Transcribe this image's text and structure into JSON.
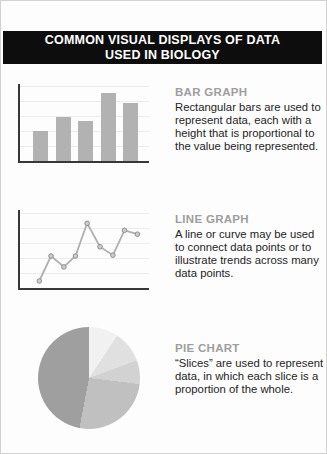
{
  "header": {
    "title_line1": "COMMON VISUAL DISPLAYS OF DATA",
    "title_line2": "USED IN BIOLOGY",
    "bg_color": "#0d0d0d",
    "text_color": "#ffffff"
  },
  "sections": {
    "bar": {
      "heading": "BAR GRAPH",
      "body": "Rectangular bars are used to represent data, each with a height that is proportional to the value being represented."
    },
    "line": {
      "heading": "LINE GRAPH",
      "body": "A line or curve may be used to connect data points or to illustrate trends across many data points."
    },
    "pie": {
      "heading": "PIE CHART",
      "body": "“Slices” are used to represent data, in which each slice is a proportion of the whole."
    }
  },
  "chart_data": [
    {
      "type": "bar",
      "name": "bar-graph-example",
      "title": "",
      "xlabel": "",
      "ylabel": "",
      "categories": [
        "bar-1",
        "bar-2",
        "bar-3",
        "bar-4",
        "bar-5"
      ],
      "values": [
        39,
        57,
        52,
        88,
        75
      ],
      "ylim": [
        0,
        100
      ],
      "grid": true,
      "legend": false,
      "bar_color": "#b2b2b2",
      "axis_color": "#383838",
      "gridline_color": "#ececec"
    },
    {
      "type": "line",
      "name": "line-graph-example",
      "title": "",
      "xlabel": "",
      "ylabel": "",
      "x": [
        15,
        24,
        34,
        43,
        52,
        62,
        72,
        81,
        91
      ],
      "y": [
        9,
        41,
        27,
        41,
        83,
        53,
        42,
        74,
        69
      ],
      "xlim": [
        0,
        100
      ],
      "ylim": [
        0,
        100
      ],
      "grid": true,
      "legend": false,
      "line_color": "#b0b0b0",
      "marker_color": "#cdcdcd",
      "marker_edge_color": "#8f8f8f",
      "axis_color": "#383838",
      "gridline_color": "#ececec"
    },
    {
      "type": "pie",
      "name": "pie-chart-example",
      "title": "",
      "legend": false,
      "start_angle_deg": 0,
      "slices": [
        {
          "label": "slice-1",
          "percent": 9.4,
          "color": "#f1f1f1"
        },
        {
          "label": "slice-2",
          "percent": 10.0,
          "color": "#e0e0e0"
        },
        {
          "label": "slice-3",
          "percent": 7.5,
          "color": "#d2d2d2"
        },
        {
          "label": "slice-4",
          "percent": 26.1,
          "color": "#c0c0c0"
        },
        {
          "label": "slice-5",
          "percent": 47.0,
          "color": "#9f9f9f"
        }
      ]
    }
  ]
}
